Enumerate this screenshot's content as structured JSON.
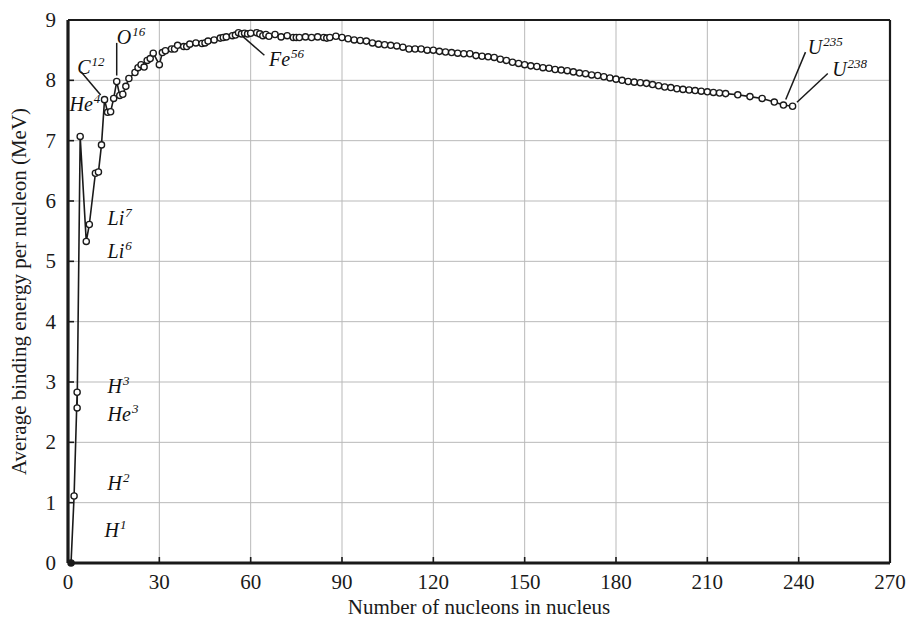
{
  "chart_data": {
    "type": "line",
    "title": "",
    "subtitle": "",
    "xlabel": "Number of nucleons in nucleus",
    "ylabel": "Average binding energy per nucleon (MeV)",
    "xlim": [
      0,
      270
    ],
    "ylim": [
      0,
      9
    ],
    "xticks": [
      0,
      30,
      60,
      90,
      120,
      150,
      180,
      210,
      240,
      270
    ],
    "yticks": [
      0,
      1,
      2,
      3,
      4,
      5,
      6,
      7,
      8,
      9
    ],
    "xtick_labels": [
      "0",
      "30",
      "60",
      "90",
      "120",
      "150",
      "180",
      "210",
      "240",
      "270"
    ],
    "ytick_labels": [
      "0",
      "1",
      "2",
      "3",
      "4",
      "5",
      "6",
      "7",
      "8",
      "9"
    ],
    "grid": true,
    "grid_color": "#b9b9b9",
    "legend": "none",
    "marker": "open-circle",
    "line_color": "#1a1a1a",
    "marker_face_color": "#ffffff",
    "series": [
      {
        "name": "Average binding energy per nucleon",
        "x": [
          1,
          2,
          3,
          3,
          4,
          6,
          7,
          9,
          10,
          11,
          12,
          13,
          14,
          15,
          16,
          17,
          18,
          19,
          20,
          22,
          23,
          24,
          25,
          26,
          27,
          28,
          30,
          31,
          32,
          34,
          35,
          36,
          38,
          39,
          40,
          42,
          44,
          45,
          46,
          48,
          50,
          51,
          52,
          54,
          55,
          56,
          57,
          58,
          59,
          60,
          62,
          63,
          64,
          65,
          66,
          68,
          70,
          72,
          74,
          75,
          76,
          78,
          80,
          82,
          84,
          85,
          86,
          88,
          90,
          92,
          94,
          96,
          98,
          100,
          102,
          104,
          106,
          108,
          110,
          112,
          114,
          116,
          118,
          120,
          122,
          124,
          126,
          128,
          130,
          132,
          134,
          136,
          138,
          140,
          142,
          144,
          146,
          148,
          150,
          152,
          154,
          156,
          158,
          160,
          162,
          164,
          166,
          168,
          170,
          172,
          174,
          176,
          178,
          180,
          182,
          184,
          186,
          188,
          190,
          192,
          194,
          196,
          198,
          200,
          202,
          204,
          206,
          208,
          210,
          212,
          214,
          216,
          220,
          224,
          228,
          232,
          235,
          238
        ],
        "y": [
          0.0,
          1.11,
          2.83,
          2.57,
          7.07,
          5.33,
          5.61,
          6.46,
          6.48,
          6.93,
          7.68,
          7.47,
          7.48,
          7.7,
          7.98,
          7.75,
          7.77,
          7.9,
          8.03,
          8.13,
          8.21,
          8.26,
          8.22,
          8.33,
          8.36,
          8.45,
          8.26,
          8.46,
          8.49,
          8.52,
          8.52,
          8.58,
          8.56,
          8.56,
          8.6,
          8.62,
          8.61,
          8.62,
          8.65,
          8.67,
          8.7,
          8.71,
          8.72,
          8.74,
          8.75,
          8.79,
          8.77,
          8.78,
          8.77,
          8.78,
          8.79,
          8.77,
          8.74,
          8.76,
          8.73,
          8.76,
          8.72,
          8.74,
          8.71,
          8.71,
          8.71,
          8.72,
          8.71,
          8.72,
          8.71,
          8.7,
          8.71,
          8.73,
          8.71,
          8.69,
          8.67,
          8.66,
          8.65,
          8.62,
          8.6,
          8.59,
          8.58,
          8.57,
          8.55,
          8.52,
          8.52,
          8.52,
          8.5,
          8.5,
          8.48,
          8.47,
          8.46,
          8.45,
          8.44,
          8.44,
          8.41,
          8.4,
          8.39,
          8.38,
          8.35,
          8.33,
          8.3,
          8.28,
          8.26,
          8.24,
          8.23,
          8.21,
          8.2,
          8.18,
          8.17,
          8.16,
          8.14,
          8.12,
          8.11,
          8.09,
          8.08,
          8.06,
          8.04,
          8.02,
          8.0,
          7.98,
          7.97,
          7.96,
          7.95,
          7.93,
          7.91,
          7.89,
          7.88,
          7.86,
          7.85,
          7.84,
          7.83,
          7.82,
          7.81,
          7.8,
          7.79,
          7.78,
          7.76,
          7.73,
          7.7,
          7.64,
          7.59,
          7.57
        ]
      }
    ],
    "annotations": [
      {
        "label": "H",
        "superscript": "1",
        "x": 1,
        "y": 0.0,
        "lx": 12,
        "ly": 0.55
      },
      {
        "label": "H",
        "superscript": "2",
        "x": 2,
        "y": 1.11,
        "lx": 13,
        "ly": 1.32
      },
      {
        "label": "H",
        "superscript": "3",
        "x": 3,
        "y": 2.83,
        "lx": 13,
        "ly": 2.93
      },
      {
        "label": "He",
        "superscript": "3",
        "x": 3,
        "y": 2.57,
        "lx": 13,
        "ly": 2.47
      },
      {
        "label": "He",
        "superscript": "4",
        "x": 4,
        "y": 7.07,
        "lx": 0.5,
        "ly": 7.6
      },
      {
        "label": "Li",
        "superscript": "6",
        "x": 6,
        "y": 5.33,
        "lx": 13,
        "ly": 5.17
      },
      {
        "label": "Li",
        "superscript": "7",
        "x": 7,
        "y": 5.61,
        "lx": 13,
        "ly": 5.72
      },
      {
        "label": "C",
        "superscript": "12",
        "x": 12,
        "y": 7.68,
        "lx": 3,
        "ly": 8.22
      },
      {
        "label": "O",
        "superscript": "16",
        "x": 16,
        "y": 7.98,
        "lx": 16,
        "ly": 8.72
      },
      {
        "label": "Fe",
        "superscript": "56",
        "x": 56,
        "y": 8.79,
        "lx": 66,
        "ly": 8.35
      },
      {
        "label": "U",
        "superscript": "235",
        "x": 235,
        "y": 7.59,
        "lx": 243,
        "ly": 8.56
      },
      {
        "label": "U",
        "superscript": "238",
        "x": 238,
        "y": 7.57,
        "lx": 251,
        "ly": 8.18
      }
    ]
  },
  "axes": {
    "x_title": "Number of nucleons in nucleus",
    "y_title": "Average binding energy per nucleon (MeV)"
  }
}
